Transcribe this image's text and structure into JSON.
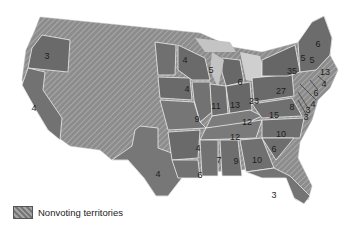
{
  "map": {
    "type": "choropleth-grayscale",
    "subject": "United States - votes per state",
    "colors": {
      "background": "#ffffff",
      "land_territory": "#8e8e8e",
      "state": "#6e6e6e",
      "great_lakes": "#c4c4c4",
      "border": "#f2f2f2",
      "label": "#1e1e1e"
    },
    "states": [
      {
        "id": "OR",
        "value": "3"
      },
      {
        "id": "CA",
        "value": "4"
      },
      {
        "id": "TX",
        "value": "4"
      },
      {
        "id": "MN",
        "value": "4"
      },
      {
        "id": "IA",
        "value": "4"
      },
      {
        "id": "WI",
        "value": "5"
      },
      {
        "id": "MI",
        "value": "6"
      },
      {
        "id": "IL",
        "value": "11"
      },
      {
        "id": "IN",
        "value": "13"
      },
      {
        "id": "OH",
        "value": "23"
      },
      {
        "id": "MO",
        "value": "9"
      },
      {
        "id": "KY",
        "value": "12"
      },
      {
        "id": "TN",
        "value": "12"
      },
      {
        "id": "AR",
        "value": "4"
      },
      {
        "id": "LA",
        "value": "6"
      },
      {
        "id": "MS",
        "value": "7"
      },
      {
        "id": "AL",
        "value": "9"
      },
      {
        "id": "GA",
        "value": "10"
      },
      {
        "id": "FL",
        "value": "3"
      },
      {
        "id": "SC",
        "value": "6"
      },
      {
        "id": "NC",
        "value": "10"
      },
      {
        "id": "VA",
        "value": "15"
      },
      {
        "id": "PA",
        "value": "27"
      },
      {
        "id": "NY",
        "value": "35"
      },
      {
        "id": "VT",
        "value": "5"
      },
      {
        "id": "NH",
        "value": "5"
      },
      {
        "id": "ME",
        "value": "6"
      },
      {
        "id": "MA",
        "value": "13"
      },
      {
        "id": "RI",
        "value": "4"
      },
      {
        "id": "CT",
        "value": "6"
      },
      {
        "id": "NJ",
        "value": "4"
      },
      {
        "id": "DE",
        "value": "3"
      },
      {
        "id": "MD",
        "value": "8"
      },
      {
        "id": "MD2",
        "value": "3"
      }
    ]
  },
  "legend": {
    "items": [
      {
        "label": "Nonvoting territories",
        "pattern": "diagonal-hatch"
      }
    ]
  }
}
